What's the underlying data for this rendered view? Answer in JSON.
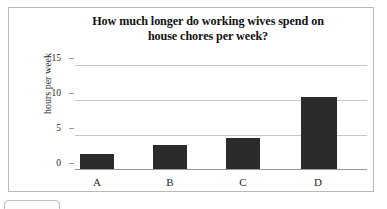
{
  "chart_data": {
    "type": "bar",
    "title": "How much longer do working wives spend on house chores per week?",
    "title_line1": "How much longer do working wives spend on",
    "title_line2": "house chores per week?",
    "xlabel": "",
    "ylabel": "hours per week",
    "categories": [
      "A",
      "B",
      "C",
      "D"
    ],
    "values": [
      2.2,
      3.5,
      4.4,
      10.3
    ],
    "ylim": [
      0,
      15
    ],
    "yticks": [
      0,
      5,
      10,
      15
    ],
    "ytick_labels": [
      "0",
      "5",
      "10",
      "15"
    ],
    "grid": true,
    "legend": false,
    "bar_color": "#2b2b2b",
    "gridline_color": "#c7c7c7",
    "axis_color": "#9a9a9a",
    "frame_border_color": "#b9b9b9",
    "background": "#ffffff"
  }
}
